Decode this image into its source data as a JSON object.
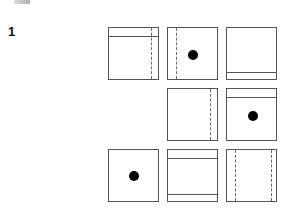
{
  "puzzle": {
    "number": "1",
    "grid": {
      "rows": 3,
      "cols": 3,
      "cells": [
        {
          "row": 0,
          "col": 0,
          "present": true,
          "hlines": [
            8
          ],
          "vdashes": [
            42
          ],
          "dot": null
        },
        {
          "row": 0,
          "col": 1,
          "present": true,
          "hlines": [],
          "vdashes": [
            8
          ],
          "dot": [
            25,
            27
          ]
        },
        {
          "row": 0,
          "col": 2,
          "present": true,
          "hlines": [
            44
          ],
          "vdashes": [],
          "dot": null
        },
        {
          "row": 1,
          "col": 0,
          "present": false
        },
        {
          "row": 1,
          "col": 1,
          "present": true,
          "hlines": [],
          "vdashes": [
            42
          ],
          "dot": null
        },
        {
          "row": 1,
          "col": 2,
          "present": true,
          "hlines": [
            8
          ],
          "vdashes": [],
          "dot": [
            26,
            27
          ]
        },
        {
          "row": 2,
          "col": 0,
          "present": true,
          "hlines": [],
          "vdashes": [],
          "dot": [
            25,
            26
          ]
        },
        {
          "row": 2,
          "col": 1,
          "present": true,
          "hlines": [
            8,
            44
          ],
          "vdashes": [],
          "dot": null
        },
        {
          "row": 2,
          "col": 2,
          "present": true,
          "hlines": [],
          "vdashes": [
            8,
            44
          ],
          "dot": null
        }
      ]
    }
  },
  "colors": {
    "line": "#555555",
    "dot": "#000000",
    "background": "#ffffff"
  }
}
